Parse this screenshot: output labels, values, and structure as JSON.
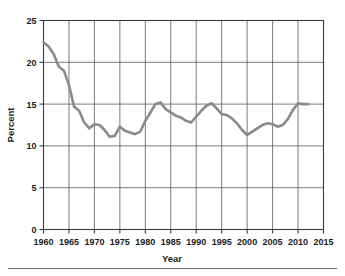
{
  "chart_data": {
    "type": "line",
    "title": "",
    "xlabel": "Year",
    "ylabel": "Percent",
    "xlim": [
      1960,
      2015
    ],
    "ylim": [
      0,
      25
    ],
    "grid": true,
    "legend": null,
    "xticks": [
      1960,
      1965,
      1970,
      1975,
      1980,
      1985,
      1990,
      1995,
      2000,
      2005,
      2010,
      2015
    ],
    "yticks": [
      0,
      5,
      10,
      15,
      20,
      25
    ],
    "xtick_labels": [
      "1960",
      "1965",
      "1970",
      "1975",
      "1980",
      "1985",
      "1990",
      "1995",
      "2000",
      "2005",
      "2010",
      "2015"
    ],
    "ytick_labels": [
      "0",
      "5",
      "10",
      "15",
      "20",
      "25"
    ],
    "line_color": "#8a8a8a",
    "line_width": 2.6,
    "series": [
      {
        "name": "Percent",
        "x": [
          1960,
          1961,
          1962,
          1963,
          1964,
          1965,
          1966,
          1967,
          1968,
          1969,
          1970,
          1971,
          1972,
          1973,
          1974,
          1975,
          1976,
          1977,
          1978,
          1979,
          1980,
          1981,
          1982,
          1983,
          1984,
          1985,
          1986,
          1987,
          1988,
          1989,
          1990,
          1991,
          1992,
          1993,
          1994,
          1995,
          1996,
          1997,
          1998,
          1999,
          2000,
          2001,
          2002,
          2003,
          2004,
          2005,
          2006,
          2007,
          2008,
          2009,
          2010,
          2011,
          2012
        ],
        "values": [
          22.4,
          21.9,
          21.0,
          19.5,
          19.0,
          17.3,
          14.7,
          14.2,
          12.8,
          12.1,
          12.6,
          12.5,
          11.9,
          11.1,
          11.2,
          12.3,
          11.8,
          11.6,
          11.4,
          11.7,
          13.0,
          14.0,
          15.0,
          15.2,
          14.4,
          14.0,
          13.6,
          13.4,
          13.0,
          12.8,
          13.5,
          14.2,
          14.8,
          15.1,
          14.5,
          13.8,
          13.7,
          13.3,
          12.7,
          11.9,
          11.3,
          11.7,
          12.1,
          12.5,
          12.7,
          12.6,
          12.3,
          12.5,
          13.2,
          14.3,
          15.1,
          15.0,
          15.0
        ]
      }
    ]
  },
  "axes": {
    "y_title": "Percent",
    "x_title": "Year"
  }
}
